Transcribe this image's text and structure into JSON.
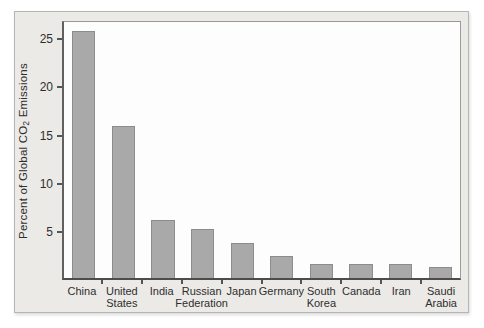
{
  "chart_data": {
    "type": "bar",
    "title": "",
    "xlabel": "",
    "ylabel": "Percent of Global CO2 Emissions",
    "ylabel_parts": {
      "pre": "Percent of Global CO",
      "sub": "2",
      "post": " Emissions"
    },
    "categories": [
      "China",
      "United States",
      "India",
      "Russian Federation",
      "Japan",
      "Germany",
      "South Korea",
      "Canada",
      "Iran",
      "Saudi Arabia"
    ],
    "values": [
      26,
      16,
      6.1,
      5.1,
      3.7,
      2.3,
      1.5,
      1.5,
      1.5,
      1.2
    ],
    "yticks": [
      5,
      10,
      15,
      20,
      25
    ],
    "ylim": [
      0,
      26.9
    ],
    "grid": false,
    "legend": false,
    "colors": {
      "bar_fill": "#a9a9a9",
      "bar_border": "#8c8c8c",
      "figure_bg": "#eceae7",
      "plot_bg": "#fdfdfd",
      "axis": "#4c4c4c",
      "tick": "#555555",
      "text": "#2e2e2e",
      "figure_border": "#b5b5b5"
    }
  }
}
